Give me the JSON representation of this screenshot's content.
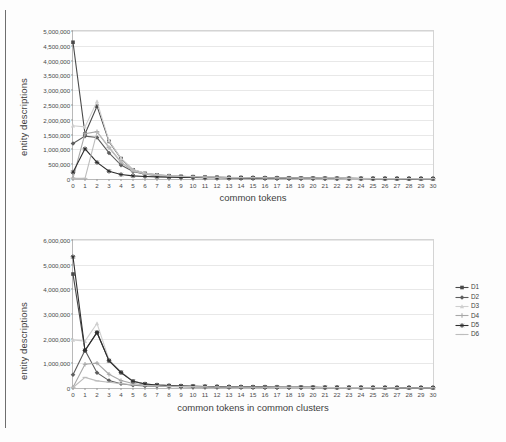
{
  "page": {
    "background": "#fdfdfd",
    "edge_color": "#6e6e6e"
  },
  "legend": {
    "position": "right-of-bottom-chart",
    "entries": [
      {
        "label": "D1",
        "color": "#4a4a4a",
        "marker": "square"
      },
      {
        "label": "D2",
        "color": "#5d5d5d",
        "marker": "diamond"
      },
      {
        "label": "D3",
        "color": "#cfcfcf",
        "marker": "triangle"
      },
      {
        "label": "D4",
        "color": "#a8a8a8",
        "marker": "cross"
      },
      {
        "label": "D5",
        "color": "#2e2e2e",
        "marker": "star"
      },
      {
        "label": "D6",
        "color": "#bdbdbd",
        "marker": "line"
      }
    ]
  },
  "chart_data": [
    {
      "id": "top",
      "type": "line",
      "title": "",
      "xlabel": "common tokens",
      "ylabel": "entity descriptions",
      "xlim": [
        0,
        30
      ],
      "ylim": [
        0,
        5000000
      ],
      "grid": true,
      "legend_position": "none",
      "x": [
        0,
        1,
        2,
        3,
        4,
        5,
        6,
        7,
        8,
        9,
        10,
        11,
        12,
        13,
        14,
        15,
        16,
        17,
        18,
        19,
        20,
        21,
        22,
        23,
        24,
        25,
        26,
        27,
        28,
        29,
        30
      ],
      "ytick_labels": [
        "0",
        "500,000",
        "1,000,000",
        "1,500,000",
        "2,000,000",
        "2,500,000",
        "3,000,000",
        "3,500,000",
        "4,000,000",
        "4,500,000",
        "5,000,000"
      ],
      "ytick_values": [
        0,
        500000,
        1000000,
        1500000,
        2000000,
        2500000,
        3000000,
        3500000,
        4000000,
        4500000,
        5000000
      ],
      "series": [
        {
          "name": "D1",
          "color": "#4a4a4a",
          "values": [
            4620000,
            1520000,
            2460000,
            1270000,
            690000,
            310000,
            190000,
            140000,
            110000,
            90000,
            78000,
            68000,
            60000,
            53000,
            47000,
            42000,
            38000,
            34000,
            31000,
            28000,
            26000,
            24000,
            22000,
            20000,
            19000,
            17000,
            16000,
            15000,
            14000,
            13000,
            12000
          ]
        },
        {
          "name": "D2",
          "color": "#5d5d5d",
          "values": [
            1200000,
            1450000,
            1400000,
            880000,
            470000,
            250000,
            160000,
            120000,
            95000,
            80000,
            70000,
            62000,
            55000,
            49000,
            44000,
            40000,
            36000,
            33000,
            30000,
            27000,
            25000,
            23000,
            21000,
            20000,
            18000,
            17000,
            16000,
            15000,
            14000,
            13000,
            12000
          ]
        },
        {
          "name": "D3",
          "color": "#cfcfcf",
          "values": [
            1800000,
            1760000,
            2620000,
            1290000,
            700000,
            320000,
            200000,
            145000,
            115000,
            95000,
            80000,
            70000,
            62000,
            55000,
            49000,
            44000,
            40000,
            36000,
            33000,
            30000,
            27000,
            25000,
            23000,
            21000,
            20000,
            18000,
            17000,
            16000,
            15000,
            14000,
            13000
          ]
        },
        {
          "name": "D4",
          "color": "#a8a8a8",
          "values": [
            30000,
            1530000,
            1600000,
            1060000,
            560000,
            270000,
            170000,
            125000,
            100000,
            84000,
            72000,
            64000,
            57000,
            51000,
            46000,
            41000,
            37000,
            34000,
            31000,
            28000,
            26000,
            24000,
            22000,
            20000,
            19000,
            17000,
            16000,
            15000,
            14000,
            13000,
            12000
          ]
        },
        {
          "name": "D5",
          "color": "#2e2e2e",
          "values": [
            230000,
            1020000,
            560000,
            260000,
            150000,
            105000,
            85000,
            72000,
            62000,
            55000,
            49000,
            44000,
            40000,
            36000,
            33000,
            30000,
            28000,
            26000,
            24000,
            22000,
            20000,
            19000,
            17000,
            16000,
            15000,
            14000,
            13000,
            12000,
            11000,
            10000,
            9000
          ]
        },
        {
          "name": "D6",
          "color": "#bdbdbd",
          "values": [
            20000,
            20000,
            1580000,
            1080000,
            580000,
            280000,
            175000,
            130000,
            102000,
            86000,
            74000,
            65000,
            58000,
            52000,
            47000,
            42000,
            38000,
            35000,
            32000,
            29000,
            27000,
            25000,
            23000,
            21000,
            19000,
            18000,
            17000,
            16000,
            15000,
            14000,
            13000
          ]
        }
      ]
    },
    {
      "id": "bottom",
      "type": "line",
      "title": "",
      "xlabel": "common tokens in common clusters",
      "ylabel": "entity descriptions",
      "xlim": [
        0,
        30
      ],
      "ylim": [
        0,
        6000000
      ],
      "grid": true,
      "legend_position": "right",
      "x": [
        0,
        1,
        2,
        3,
        4,
        5,
        6,
        7,
        8,
        9,
        10,
        11,
        12,
        13,
        14,
        15,
        16,
        17,
        18,
        19,
        20,
        21,
        22,
        23,
        24,
        25,
        26,
        27,
        28,
        29,
        30
      ],
      "ytick_labels": [
        "0",
        "1,000,000",
        "2,000,000",
        "3,000,000",
        "4,000,000",
        "5,000,000",
        "6,000,000"
      ],
      "ytick_values": [
        0,
        1000000,
        2000000,
        3000000,
        4000000,
        5000000,
        6000000
      ],
      "series": [
        {
          "name": "D1",
          "color": "#4a4a4a",
          "values": [
            4620000,
            1520000,
            2250000,
            1110000,
            630000,
            270000,
            160000,
            120000,
            95000,
            80000,
            70000,
            62000,
            55000,
            49000,
            44000,
            40000,
            36000,
            33000,
            30000,
            27000,
            25000,
            23000,
            21000,
            20000,
            18000,
            17000,
            16000,
            15000,
            14000,
            13000,
            12000
          ]
        },
        {
          "name": "D2",
          "color": "#5d5d5d",
          "values": [
            540000,
            1530000,
            620000,
            300000,
            170000,
            110000,
            85000,
            70000,
            60000,
            52000,
            46000,
            41000,
            37000,
            33000,
            30000,
            28000,
            26000,
            24000,
            22000,
            20000,
            19000,
            17000,
            16000,
            15000,
            14000,
            13000,
            12000,
            11000,
            10000,
            9500,
            9000
          ]
        },
        {
          "name": "D3",
          "color": "#cfcfcf",
          "values": [
            1950000,
            1900000,
            2620000,
            1150000,
            650000,
            280000,
            165000,
            122000,
            97000,
            82000,
            71000,
            63000,
            56000,
            50000,
            45000,
            41000,
            37000,
            34000,
            31000,
            28000,
            26000,
            24000,
            22000,
            20000,
            19000,
            17000,
            16000,
            15000,
            14000,
            13000,
            12000
          ]
        },
        {
          "name": "D4",
          "color": "#a8a8a8",
          "values": [
            30000,
            960000,
            1010000,
            560000,
            300000,
            180000,
            120000,
            95000,
            78000,
            67000,
            59000,
            52000,
            47000,
            42000,
            38000,
            35000,
            32000,
            29000,
            27000,
            25000,
            23000,
            21000,
            20000,
            18000,
            17000,
            16000,
            15000,
            14000,
            13000,
            12000,
            11000
          ]
        },
        {
          "name": "D5",
          "color": "#2e2e2e",
          "values": [
            5320000,
            1520000,
            2250000,
            1110000,
            630000,
            270000,
            160000,
            120000,
            95000,
            80000,
            70000,
            62000,
            55000,
            49000,
            44000,
            40000,
            36000,
            33000,
            30000,
            27000,
            25000,
            23000,
            21000,
            20000,
            18000,
            17000,
            16000,
            15000,
            14000,
            13000,
            12000
          ]
        },
        {
          "name": "D6",
          "color": "#bdbdbd",
          "values": [
            20000,
            430000,
            290000,
            230000,
            175000,
            130000,
            100000,
            82000,
            70000,
            61000,
            54000,
            48000,
            43000,
            39000,
            35000,
            32000,
            30000,
            27000,
            25000,
            23000,
            21000,
            20000,
            18000,
            17000,
            16000,
            15000,
            14000,
            13000,
            12000,
            11000,
            10000
          ]
        }
      ]
    }
  ]
}
